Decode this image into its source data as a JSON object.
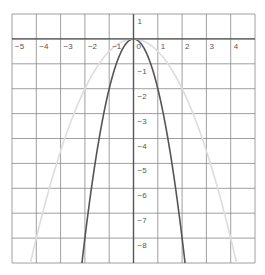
{
  "chart_data": {
    "type": "line",
    "title": "",
    "xlabel": "",
    "ylabel": "",
    "xlim": [
      -5,
      5
    ],
    "ylim": [
      -9,
      1
    ],
    "grid": true,
    "x_ticks": [
      -5,
      -4,
      -3,
      -2,
      -1,
      0,
      1,
      2,
      3,
      4
    ],
    "x_tick_labels": [
      "−5",
      "−4",
      "−3",
      "−2",
      "−1",
      "0",
      "1",
      "2",
      "3",
      "4"
    ],
    "y_ticks": [
      1,
      -1,
      -2,
      -3,
      -4,
      -5,
      -6,
      -7,
      -8
    ],
    "y_tick_labels": [
      "1",
      "−1",
      "−2",
      "−3",
      "−4",
      "−5",
      "−6",
      "−7",
      "−8"
    ],
    "series": [
      {
        "name": "y = -2x^2",
        "coef": -2,
        "color": "#555555",
        "width": 1.6,
        "points": [
          [
            -2,
            -8
          ],
          [
            -1,
            -2
          ],
          [
            0,
            0
          ],
          [
            1,
            -2
          ],
          [
            2,
            -8
          ]
        ]
      },
      {
        "name": "y = -x^2/2",
        "coef": -0.5,
        "color": "#dddddd",
        "width": 1.6,
        "points": [
          [
            -4,
            -8
          ],
          [
            -2,
            -2
          ],
          [
            0,
            0
          ],
          [
            2,
            -2
          ],
          [
            4,
            -8
          ]
        ]
      }
    ]
  },
  "colors": {
    "grid": "#888888",
    "axis": "#555555",
    "background": "#ffffff"
  }
}
